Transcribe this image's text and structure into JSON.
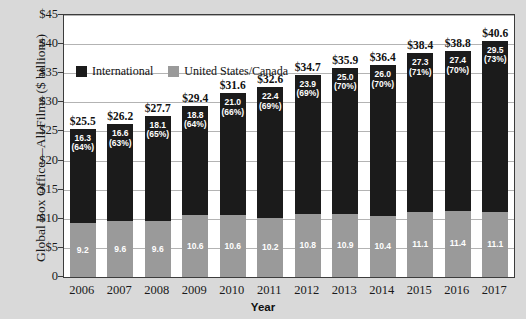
{
  "chart_data": {
    "type": "bar",
    "subtype": "stacked-bar",
    "title": "",
    "xlabel": "Year",
    "ylabel": "Global Box Office—All Films ($ billions)",
    "categories": [
      "2006",
      "2007",
      "2008",
      "2009",
      "2010",
      "2011",
      "2012",
      "2013",
      "2014",
      "2015",
      "2016",
      "2017"
    ],
    "ylim": [
      0,
      45
    ],
    "yticks": [
      0,
      5,
      10,
      15,
      20,
      25,
      30,
      35,
      40,
      45
    ],
    "ytick_labels": [
      "0",
      "$5",
      "$10",
      "$15",
      "$20",
      "$25",
      "$30",
      "$35",
      "$40",
      "$45"
    ],
    "grid": true,
    "legend_position": "upper-left-inside",
    "series": [
      {
        "name": "International",
        "color": "#1b1b1b",
        "values": [
          16.3,
          16.6,
          18.1,
          18.8,
          21.0,
          22.4,
          23.9,
          25.0,
          26.0,
          27.3,
          27.4,
          29.5
        ],
        "value_labels": [
          "16.3",
          "16.6",
          "18.1",
          "18.8",
          "21.0",
          "22.4",
          "23.9",
          "25.0",
          "26.0",
          "27.3",
          "27.4",
          "29.5"
        ],
        "percent_labels": [
          "(64%)",
          "(63%)",
          "(65%)",
          "(64%)",
          "(66%)",
          "(69%)",
          "(69%)",
          "(70%)",
          "(70%)",
          "(71%)",
          "(70%)",
          "(73%)"
        ]
      },
      {
        "name": "United States/Canada",
        "color": "#9a9a9a",
        "values": [
          9.2,
          9.6,
          9.6,
          10.6,
          10.6,
          10.2,
          10.8,
          10.9,
          10.4,
          11.1,
          11.4,
          11.1
        ],
        "value_labels": [
          "9.2",
          "9.6",
          "9.6",
          "10.6",
          "10.6",
          "10.2",
          "10.8",
          "10.9",
          "10.4",
          "11.1",
          "11.4",
          "11.1"
        ]
      }
    ],
    "totals": [
      25.5,
      26.2,
      27.7,
      29.4,
      31.6,
      32.6,
      34.7,
      35.9,
      36.4,
      38.4,
      38.8,
      40.6
    ],
    "total_labels": [
      "$25.5",
      "$26.2",
      "$27.7",
      "$29.4",
      "$31.6",
      "$32.6",
      "$34.7",
      "$35.9",
      "$36.4",
      "$38.4",
      "$38.8",
      "$40.6"
    ]
  },
  "legend": {
    "items": [
      {
        "label": "International",
        "color": "#1b1b1b"
      },
      {
        "label": "United States/Canada",
        "color": "#9a9a9a"
      }
    ]
  }
}
